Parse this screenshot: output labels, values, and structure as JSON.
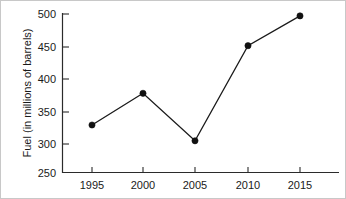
{
  "chart_data": {
    "type": "line",
    "title": "",
    "xlabel": "",
    "ylabel": "Fuel (in millions of barrels)",
    "x": [
      1995,
      2000,
      2005,
      2010,
      2015
    ],
    "categories": [
      "1995",
      "2000",
      "2005",
      "2010",
      "2015"
    ],
    "values": [
      325,
      375,
      300,
      450,
      497
    ],
    "series": [
      {
        "name": "Fuel",
        "values": [
          325,
          375,
          300,
          450,
          497
        ],
        "color": "#111111",
        "marker": "filled-circle"
      }
    ],
    "xlim": [
      1992.5,
      2017.5
    ],
    "ylim": [
      250,
      500
    ],
    "ytick_labels": [
      "250",
      "300",
      "350",
      "400",
      "450",
      "500"
    ],
    "ytick_values": [
      250,
      300,
      350,
      400,
      450,
      500
    ],
    "xtick_labels": [
      "1995",
      "2000",
      "2005",
      "2010",
      "2015"
    ],
    "xtick_values": [
      1995,
      2000,
      2005,
      2010,
      2015
    ],
    "grid": false,
    "legend": "none",
    "annotations": []
  },
  "axis": {
    "y_title": "Fuel (in millions of barrels)",
    "y_ticks": {
      "t0": "250",
      "t1": "300",
      "t2": "350",
      "t3": "400",
      "t4": "450",
      "t5": "500"
    },
    "x_ticks": {
      "t0": "1995",
      "t1": "2000",
      "t2": "2005",
      "t3": "2010",
      "t4": "2015"
    }
  }
}
